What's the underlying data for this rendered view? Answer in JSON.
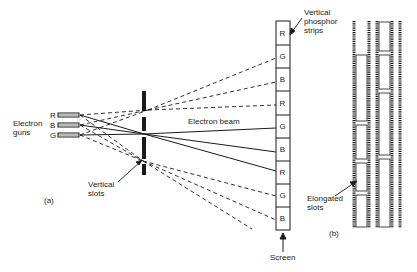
{
  "figure": {
    "panel_a": {
      "label": "(a)",
      "electron_guns": {
        "label_line1": "Electron",
        "label_line2": "guns",
        "guns": [
          "R",
          "B",
          "G"
        ]
      },
      "mask": {
        "label_line1": "Vertical",
        "label_line2": "slots"
      },
      "beam_label": "Electron beam",
      "screen": {
        "label": "Screen",
        "strips_label_line1": "Vertical",
        "strips_label_line2": "phosphor",
        "strips_label_line3": "strips",
        "strips": [
          "R",
          "G",
          "B",
          "R",
          "G",
          "B",
          "R",
          "G",
          "B"
        ]
      }
    },
    "panel_b": {
      "label": "(b)",
      "slots_label_line1": "Elongated",
      "slots_label_line2": "slots"
    },
    "colors": {
      "ink": "#1a1a1a",
      "background": "#ffffff"
    }
  }
}
